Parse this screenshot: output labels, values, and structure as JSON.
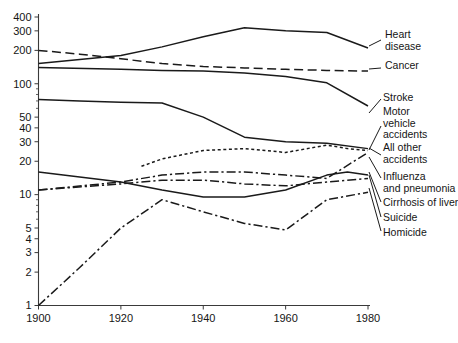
{
  "chart_data": {
    "type": "line",
    "title": "",
    "xlabel": "",
    "ylabel": "",
    "scale_y": "log",
    "xlim": [
      1900,
      1980
    ],
    "ylim": [
      1,
      400
    ],
    "grid": false,
    "legend_position": "right-inline",
    "x_ticks": [
      1900,
      1920,
      1940,
      1960,
      1980
    ],
    "x_tick_labels": [
      "1900",
      "1920",
      "1940",
      "1960",
      "1980"
    ],
    "y_ticks": [
      1,
      2,
      3,
      4,
      5,
      10,
      20,
      30,
      40,
      50,
      100,
      200,
      300,
      400
    ],
    "y_tick_labels": [
      "1",
      "2",
      "3",
      "4",
      "5",
      "10",
      "20",
      "30",
      "40",
      "50",
      "100",
      "200",
      "300",
      "400"
    ],
    "y_minor_ticks": [
      6,
      7,
      8,
      9,
      60,
      70,
      80,
      90
    ],
    "series": [
      {
        "name": "Heart disease",
        "dash": "solid",
        "x": [
          1900,
          1920,
          1930,
          1940,
          1950,
          1960,
          1970,
          1980
        ],
        "values": [
          152,
          180,
          215,
          265,
          320,
          300,
          290,
          210
        ]
      },
      {
        "name": "Cancer",
        "dash": "dashed",
        "x": [
          1900,
          1910,
          1920,
          1930,
          1940,
          1950,
          1960,
          1970,
          1980
        ],
        "values": [
          200,
          185,
          168,
          152,
          143,
          139,
          135,
          132,
          130
        ]
      },
      {
        "name": "Stroke",
        "dash": "solid",
        "x": [
          1900,
          1920,
          1930,
          1940,
          1950,
          1960,
          1970,
          1980
        ],
        "values": [
          140,
          135,
          132,
          130,
          125,
          116,
          102,
          63
        ]
      },
      {
        "name": "Motor vehicle accidents",
        "dash": "dotted",
        "x": [
          1925,
          1930,
          1940,
          1950,
          1960,
          1970,
          1975,
          1980
        ],
        "values": [
          18,
          21,
          25,
          26,
          24,
          28,
          26,
          25
        ]
      },
      {
        "name": "All other accidents",
        "dash": "solid",
        "x": [
          1900,
          1910,
          1920,
          1930,
          1940,
          1950,
          1960,
          1970,
          1980
        ],
        "values": [
          72,
          70,
          68,
          67,
          50,
          33,
          30,
          29,
          26
        ]
      },
      {
        "name": "Influenza and pneumonia",
        "dash": "dashdot",
        "x": [
          1900,
          1920,
          1930,
          1940,
          1950,
          1960,
          1970,
          1980
        ],
        "values": [
          11,
          13,
          15,
          16,
          16,
          15,
          14,
          24
        ]
      },
      {
        "name": "Cirrhosis of liver",
        "dash": "solid",
        "x": [
          1900,
          1920,
          1930,
          1940,
          1950,
          1960,
          1970,
          1975,
          1980
        ],
        "values": [
          16,
          13,
          11,
          9.5,
          9.5,
          11,
          15,
          16,
          15
        ]
      },
      {
        "name": "Suicide",
        "dash": "dashdot",
        "x": [
          1900,
          1920,
          1930,
          1940,
          1950,
          1960,
          1970,
          1980
        ],
        "values": [
          11,
          12.5,
          13.5,
          13.5,
          12.5,
          12,
          13,
          14
        ]
      },
      {
        "name": "Homicide",
        "dash": "dashdot",
        "x": [
          1900,
          1910,
          1920,
          1930,
          1940,
          1950,
          1960,
          1970,
          1980
        ],
        "values": [
          1.0,
          2.2,
          5.0,
          9.0,
          7.0,
          5.5,
          4.8,
          9.0,
          10.5
        ]
      }
    ]
  },
  "labels": {
    "heart_disease": [
      "Heart",
      "disease"
    ],
    "cancer": [
      "Cancer"
    ],
    "stroke": [
      "Stroke"
    ],
    "motor_vehicle": [
      "Motor",
      "vehicle",
      "accidents"
    ],
    "all_other": [
      "All other",
      "accidents"
    ],
    "influenza": [
      "Influenza",
      "and pneumonia"
    ],
    "cirrhosis": [
      "Cirrhosis of liver"
    ],
    "suicide": [
      "Suicide"
    ],
    "homicide": [
      "Homicide"
    ]
  }
}
